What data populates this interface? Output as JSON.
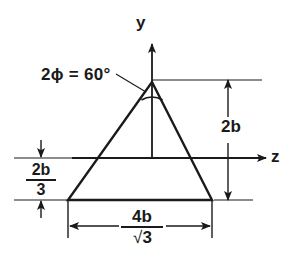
{
  "figure": {
    "axes": {
      "y_label": "y",
      "z_label": "z"
    },
    "annotations": {
      "apex_angle": "2ϕ = 60°",
      "height_dimension": "2b",
      "centroid_offset": {
        "numerator": "2b",
        "denominator": "3"
      },
      "base_dimension": {
        "numerator": "4b",
        "denominator_radical": "√",
        "denominator_value": "3"
      }
    },
    "colors": {
      "line": "#1a1a1a",
      "background": "#ffffff"
    }
  }
}
